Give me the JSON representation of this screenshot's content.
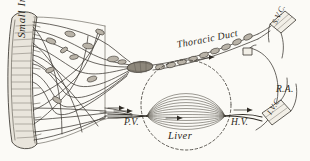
{
  "figure": {
    "background_color": "#fbfaf6",
    "ink_color": "#3a3630",
    "width": 310,
    "height": 161
  },
  "labels": {
    "small_intestine": "Small Intestine",
    "thoracic_duct": "Thoracic Duct",
    "svc": "S.V.C.",
    "right_atrium": "R.A.",
    "ivc": "I.V.C.",
    "portal_vein": "P.V.",
    "hepatic_vein": "H.V.",
    "liver": "Liver"
  },
  "structures": {
    "small_intestine": {
      "name": "small-intestine",
      "description": "vertical tubular segment of gut wall with villi hatching at far left"
    },
    "mesenteric_lymphatics": {
      "name": "mesenteric-lymphatic-network",
      "description": "fan of branching lacteal vessels spreading from intestine to converge at right",
      "lymph_node_count": 11
    },
    "thoracic_duct": {
      "name": "thoracic-duct",
      "description": "beaded valved lymph duct running up and to the right toward the subclavian junction"
    },
    "cisterna": {
      "name": "cisterna-chyli",
      "description": "enlarged sac where mesenteric lymphatics join the thoracic duct"
    },
    "liver": {
      "name": "liver",
      "description": "dashed circular outline enclosing a lens-shaped sinusoidal capillary bed"
    },
    "portal_vein": {
      "name": "portal-vein",
      "description": "vein carrying blood from intestine into the liver"
    },
    "hepatic_vein": {
      "name": "hepatic-vein",
      "description": "vein draining the liver into the inferior vena cava"
    },
    "inferior_vena_cava": {
      "name": "inferior-vena-cava",
      "description": "large vein ascending to the right atrium"
    },
    "superior_vena_cava": {
      "name": "superior-vena-cava",
      "description": "vein at upper right receiving the thoracic duct"
    },
    "right_atrium": {
      "name": "right-atrium",
      "description": "heart chamber outline at right receiving both venae cavae"
    }
  },
  "flow_arrows": [
    {
      "name": "arrow-lymph-mesentery",
      "direction": "right"
    },
    {
      "name": "arrow-thoracic-duct",
      "direction": "right"
    },
    {
      "name": "arrow-portal-inflow",
      "direction": "right"
    },
    {
      "name": "arrow-hepatic-outflow",
      "direction": "right"
    },
    {
      "name": "arrow-ivc-ascending",
      "direction": "right"
    }
  ]
}
